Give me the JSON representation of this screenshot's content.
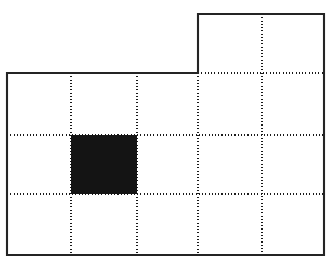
{
  "figure": {
    "background_color": "#ffffff",
    "outline_color": "#242424",
    "grid_line_color": "#1a1a1a",
    "filled_cell_color": "#141414",
    "canvas": {
      "width": 332,
      "height": 264
    },
    "grid": {
      "x_positions": [
        7,
        71,
        137,
        198,
        262,
        324
      ],
      "y_positions": [
        14,
        73,
        135,
        194,
        255
      ],
      "columns": 5,
      "rows": 4,
      "line_style": "dotted"
    },
    "outline_path": "M 198 14 L 324 14 L 324 255 L 7 255 L 7 73 L 198 73 Z",
    "outline_vertices": [
      {
        "x": 198,
        "y": 14
      },
      {
        "x": 324,
        "y": 14
      },
      {
        "x": 324,
        "y": 255
      },
      {
        "x": 7,
        "y": 255
      },
      {
        "x": 7,
        "y": 73
      },
      {
        "x": 198,
        "y": 73
      }
    ],
    "filled_cells": [
      {
        "col": 1,
        "row": 1,
        "x": 71,
        "y": 135,
        "width": 66,
        "height": 59
      }
    ],
    "interior_dotted_verticals": [
      {
        "x": 71,
        "y1": 73,
        "y2": 255
      },
      {
        "x": 137,
        "y1": 73,
        "y2": 255
      },
      {
        "x": 198,
        "y1": 73,
        "y2": 255
      },
      {
        "x": 262,
        "y1": 14,
        "y2": 255
      }
    ],
    "interior_dotted_horizontals": [
      {
        "y": 73,
        "x1": 198,
        "x2": 324
      },
      {
        "y": 135,
        "x1": 7,
        "x2": 324
      },
      {
        "y": 194,
        "x1": 7,
        "x2": 324
      }
    ]
  }
}
